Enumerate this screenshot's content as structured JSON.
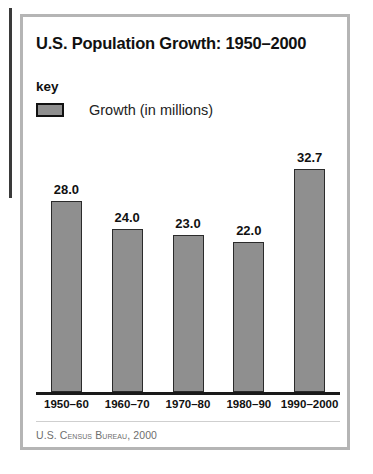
{
  "chart_data": {
    "type": "bar",
    "title": "U.S. Population Growth: 1950–2000",
    "xlabel": "",
    "ylabel": "Growth (in millions)",
    "categories": [
      "1950–60",
      "1960–70",
      "1970–80",
      "1980–90",
      "1990–2000"
    ],
    "values": [
      28.0,
      24.0,
      23.0,
      22.0,
      32.7
    ],
    "value_labels": [
      "28.0",
      "24.0",
      "23.0",
      "22.0",
      "32.7"
    ],
    "series": [
      {
        "name": "Growth (in millions)",
        "values": [
          28.0,
          24.0,
          23.0,
          22.0,
          32.7
        ]
      }
    ],
    "ylim": [
      0,
      36
    ],
    "grid": false,
    "legend_position": "top-left",
    "bar_color": "#8f8f8f",
    "bar_border_color": "#2b2b2b",
    "axis_color": "#1a1a1a"
  },
  "legend": {
    "heading": "key",
    "entries": [
      {
        "label": "Growth (in millions)",
        "swatch_color": "#8f8f8f"
      }
    ]
  },
  "source": {
    "text": "U.S. Census Bureau, 2000"
  },
  "frame": {
    "border_color": "#b5b5b5",
    "background": "#ffffff"
  }
}
